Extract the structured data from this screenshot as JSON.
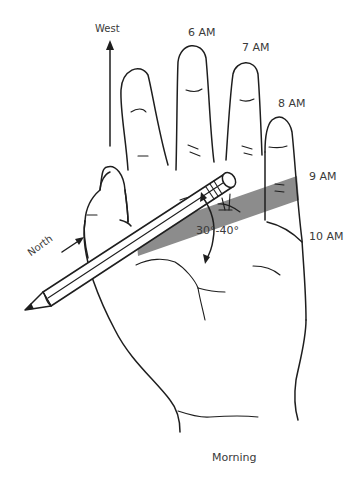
{
  "figure": {
    "caption": "Morning",
    "direction_labels": {
      "west": "West",
      "north": "North"
    },
    "time_labels": [
      "6 AM",
      "7 AM",
      "8 AM",
      "9 AM",
      "10 AM"
    ],
    "angle_label": "30°-40°",
    "colors": {
      "line": "#1e1e1e",
      "shadow_band": "#8c8c8c",
      "text": "#3a3a3a",
      "background": "#ffffff"
    },
    "elements": {
      "hand": "left hand, palm facing viewer, fingers up",
      "pencil": "held diagonally between thumb and palm, tip pointing lower-left",
      "shadow": "gray shadow band cast across palm toward 9 AM",
      "west_arrow": "vertical arrow pointing up",
      "north_arrow": "small arrow along pencil pointing toward upper-right",
      "angle_arrow": "curved double-headed arrow between pencil and shadow"
    }
  }
}
